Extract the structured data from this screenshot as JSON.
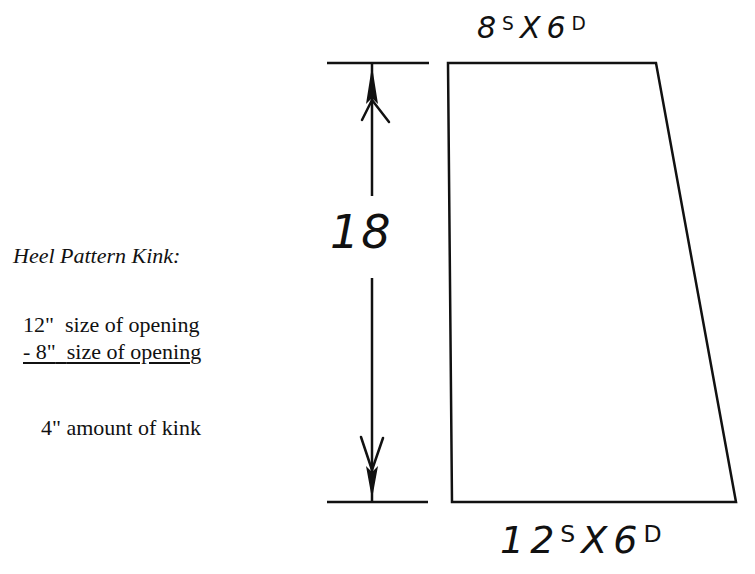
{
  "diagram": {
    "notes": {
      "title": "Heel Pattern Kink:",
      "lines": [
        {
          "value": "12\"",
          "text": "size of opening"
        },
        {
          "value": "- 8\"",
          "text": "size of opening"
        },
        {
          "value": "4\"",
          "text": "amount of kink"
        }
      ]
    },
    "shape": {
      "type": "trapezoid",
      "top_spec": {
        "number": "8",
        "sup": "S",
        "x": "X",
        "value": "6",
        "sup2": "D"
      },
      "bottom_spec": {
        "number": "12",
        "sup": "S",
        "x": "X",
        "value": "6",
        "sup2": "D"
      },
      "height_label": "18",
      "vertices": {
        "top_left": [
          448,
          63
        ],
        "top_right": [
          656,
          63
        ],
        "bottom_right": [
          736,
          502
        ],
        "bottom_left": [
          452,
          502
        ]
      }
    },
    "dimension": {
      "x": 372,
      "top_y": 63,
      "bottom_y": 502,
      "ext_line_x1": 327,
      "ext_line_x2": 429
    },
    "colors": {
      "ink": "#111111",
      "background": "#ffffff"
    }
  }
}
